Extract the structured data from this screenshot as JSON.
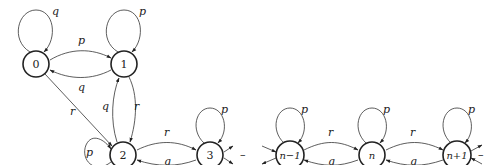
{
  "diagram": {
    "type": "state-transition-graph",
    "nodes": [
      {
        "id": "0",
        "label": "0"
      },
      {
        "id": "1",
        "label": "1"
      },
      {
        "id": "2",
        "label": "2"
      },
      {
        "id": "3",
        "label": "3"
      },
      {
        "id": "n-1",
        "label": "n−1"
      },
      {
        "id": "n",
        "label": "n"
      },
      {
        "id": "n+1",
        "label": "n+1"
      }
    ],
    "edges": [
      {
        "from": "0",
        "to": "0",
        "label": "q"
      },
      {
        "from": "1",
        "to": "1",
        "label": "p"
      },
      {
        "from": "0",
        "to": "1",
        "label": "p"
      },
      {
        "from": "1",
        "to": "0",
        "label": "q"
      },
      {
        "from": "0",
        "to": "2",
        "label": "r"
      },
      {
        "from": "2",
        "to": "1",
        "label": "q"
      },
      {
        "from": "1",
        "to": "2",
        "label": "r"
      },
      {
        "from": "2",
        "to": "2",
        "label": "p"
      },
      {
        "from": "2",
        "to": "3",
        "label": "r"
      },
      {
        "from": "3",
        "to": "2",
        "label": "q"
      },
      {
        "from": "3",
        "to": "3",
        "label": "p"
      },
      {
        "from": "n-1",
        "to": "n-1",
        "label": "p"
      },
      {
        "from": "n-1",
        "to": "n",
        "label": "r"
      },
      {
        "from": "n",
        "to": "n-1",
        "label": "q"
      },
      {
        "from": "n",
        "to": "n",
        "label": "p"
      },
      {
        "from": "n",
        "to": "n+1",
        "label": "r"
      },
      {
        "from": "n+1",
        "to": "n",
        "label": "q"
      },
      {
        "from": "n+1",
        "to": "n+1",
        "label": "p"
      }
    ],
    "ellipsis_labels": {
      "between_3_and_n_minus_1": "–",
      "after_n_plus_1": "–"
    }
  }
}
